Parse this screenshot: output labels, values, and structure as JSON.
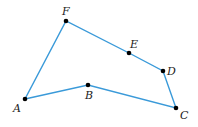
{
  "diagram": {
    "type": "polygon",
    "stroke_color": "#3a9ad9",
    "point_color": "#000000",
    "vertices": [
      {
        "label": "A",
        "x": 25,
        "y": 99,
        "lx": 13,
        "ly": 112
      },
      {
        "label": "B",
        "x": 88,
        "y": 85,
        "lx": 85,
        "ly": 99
      },
      {
        "label": "C",
        "x": 176,
        "y": 108,
        "lx": 180,
        "ly": 119
      },
      {
        "label": "D",
        "x": 163,
        "y": 71,
        "lx": 167,
        "ly": 75
      },
      {
        "label": "E",
        "x": 129,
        "y": 53,
        "lx": 130,
        "ly": 48
      },
      {
        "label": "F",
        "x": 66,
        "y": 21,
        "lx": 62,
        "ly": 15
      }
    ]
  }
}
